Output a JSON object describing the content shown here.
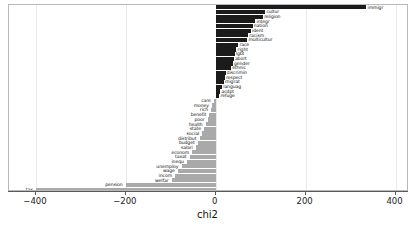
{
  "chart_data": {
    "type": "bar",
    "orientation": "horizontal",
    "title": "",
    "subtitle": "",
    "xlabel": "chi2",
    "ylabel": "",
    "xlim": [
      -460,
      430
    ],
    "ylim": [
      0,
      36
    ],
    "grid": true,
    "grid_axis": "x",
    "legend": null,
    "xticks": [
      -400,
      -200,
      0,
      200,
      400
    ],
    "xticklabels": [
      "−400",
      "−200",
      "0",
      "200",
      "400"
    ],
    "colors": {
      "positive": "#1b1b1b",
      "negative": "#a9a9a9",
      "frame": "#b9b9b9",
      "grid": "#e9e9e9",
      "axis": "#5a5a5a"
    },
    "categories": [
      "immigr",
      "cultur",
      "religion",
      "integr",
      "nation",
      "ident",
      "racism",
      "multicultur",
      "race",
      "right",
      "lgbt",
      "abort",
      "gender",
      "ethnic",
      "discrimin",
      "respect",
      "migrat",
      "languag",
      "acdpt",
      "refuge",
      "care",
      "money",
      "rich",
      "benefit",
      "poor",
      "health",
      "state",
      "social",
      "distribut",
      "budget",
      "salari",
      "econom",
      "taxat",
      "inequ",
      "unemploy",
      "wage",
      "incom",
      "welfar",
      "pension",
      "tax"
    ],
    "values": [
      335,
      110,
      105,
      88,
      82,
      78,
      72,
      70,
      50,
      46,
      42,
      40,
      38,
      34,
      22,
      20,
      18,
      14,
      10,
      8,
      -4,
      -8,
      -10,
      -14,
      -18,
      -22,
      -26,
      -30,
      -36,
      -40,
      -44,
      -52,
      -58,
      -64,
      -76,
      -84,
      -90,
      -98,
      -200,
      -400
    ],
    "bars": [
      {
        "label": "immigr",
        "value": 335,
        "sign": "positive",
        "label_side": "right"
      },
      {
        "label": "cultur",
        "value": 110,
        "sign": "positive",
        "label_side": "right"
      },
      {
        "label": "religion",
        "value": 105,
        "sign": "positive",
        "label_side": "right"
      },
      {
        "label": "integr",
        "value": 88,
        "sign": "positive",
        "label_side": "right"
      },
      {
        "label": "nation",
        "value": 82,
        "sign": "positive",
        "label_side": "right"
      },
      {
        "label": "ident",
        "value": 78,
        "sign": "positive",
        "label_side": "right"
      },
      {
        "label": "racism",
        "value": 72,
        "sign": "positive",
        "label_side": "right"
      },
      {
        "label": "multicultur",
        "value": 70,
        "sign": "positive",
        "label_side": "right"
      },
      {
        "label": "race",
        "value": 50,
        "sign": "positive",
        "label_side": "right"
      },
      {
        "label": "right",
        "value": 46,
        "sign": "positive",
        "label_side": "right"
      },
      {
        "label": "lgbt",
        "value": 42,
        "sign": "positive",
        "label_side": "right"
      },
      {
        "label": "abort",
        "value": 40,
        "sign": "positive",
        "label_side": "right"
      },
      {
        "label": "gender",
        "value": 38,
        "sign": "positive",
        "label_side": "right"
      },
      {
        "label": "ethnic",
        "value": 34,
        "sign": "positive",
        "label_side": "right"
      },
      {
        "label": "discrimin",
        "value": 22,
        "sign": "positive",
        "label_side": "right"
      },
      {
        "label": "respect",
        "value": 20,
        "sign": "positive",
        "label_side": "right"
      },
      {
        "label": "migrat",
        "value": 18,
        "sign": "positive",
        "label_side": "right"
      },
      {
        "label": "languag",
        "value": 14,
        "sign": "positive",
        "label_side": "right"
      },
      {
        "label": "acdpt",
        "value": 10,
        "sign": "positive",
        "label_side": "right"
      },
      {
        "label": "refuge",
        "value": 8,
        "sign": "positive",
        "label_side": "right"
      },
      {
        "label": "care",
        "value": -4,
        "sign": "negative",
        "label_side": "left"
      },
      {
        "label": "money",
        "value": -8,
        "sign": "negative",
        "label_side": "left"
      },
      {
        "label": "rich",
        "value": -10,
        "sign": "negative",
        "label_side": "left"
      },
      {
        "label": "benefit",
        "value": -14,
        "sign": "negative",
        "label_side": "left"
      },
      {
        "label": "poor",
        "value": -18,
        "sign": "negative",
        "label_side": "left"
      },
      {
        "label": "health",
        "value": -22,
        "sign": "negative",
        "label_side": "left"
      },
      {
        "label": "state",
        "value": -26,
        "sign": "negative",
        "label_side": "left"
      },
      {
        "label": "social",
        "value": -30,
        "sign": "negative",
        "label_side": "left"
      },
      {
        "label": "distribut",
        "value": -36,
        "sign": "negative",
        "label_side": "left"
      },
      {
        "label": "budget",
        "value": -40,
        "sign": "negative",
        "label_side": "left"
      },
      {
        "label": "salari",
        "value": -44,
        "sign": "negative",
        "label_side": "left"
      },
      {
        "label": "econom",
        "value": -52,
        "sign": "negative",
        "label_side": "left"
      },
      {
        "label": "taxat",
        "value": -58,
        "sign": "negative",
        "label_side": "left"
      },
      {
        "label": "inequ",
        "value": -64,
        "sign": "negative",
        "label_side": "left"
      },
      {
        "label": "unemploy",
        "value": -76,
        "sign": "negative",
        "label_side": "left"
      },
      {
        "label": "wage",
        "value": -84,
        "sign": "negative",
        "label_side": "left"
      },
      {
        "label": "incom",
        "value": -90,
        "sign": "negative",
        "label_side": "left"
      },
      {
        "label": "welfar",
        "value": -98,
        "sign": "negative",
        "label_side": "left"
      },
      {
        "label": "pension",
        "value": -200,
        "sign": "negative",
        "label_side": "left"
      },
      {
        "label": "tax",
        "value": -400,
        "sign": "negative",
        "label_side": "left"
      }
    ]
  }
}
